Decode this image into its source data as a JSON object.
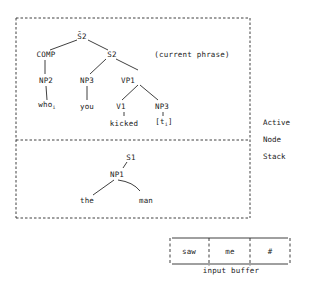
{
  "diagram": {
    "active_tree": {
      "root": "S̄2",
      "comp": "COMP",
      "s2": "S2",
      "annotation": "(current phrase)",
      "np2": "NP2",
      "np3_subject": "NP3",
      "vp1": "VP1",
      "who": "who",
      "who_subscript": "i",
      "you": "you",
      "v1": "V1",
      "np3_object": "NP3",
      "kicked": "kicked",
      "trace": "[t",
      "trace_subscript": "i",
      "trace_close": "]"
    },
    "stack_tree": {
      "root": "S1",
      "np1": "NP1",
      "the": "the",
      "man": "man"
    },
    "side_label": {
      "line1": "Active",
      "line2": "Node",
      "line3": "Stack"
    },
    "input_buffer": {
      "cells": [
        "saw",
        "me",
        "#"
      ],
      "label": "input buffer"
    },
    "colors": {
      "ink": "#1a1a1a",
      "background": "#ffffff"
    }
  }
}
